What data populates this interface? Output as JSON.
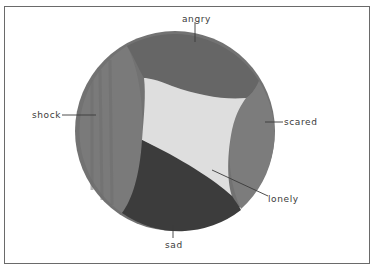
{
  "diagram": {
    "type": "emotion-wheel-drawing",
    "regions": [
      {
        "id": "angry",
        "label": "angry",
        "color": "#666666"
      },
      {
        "id": "shock",
        "label": "shock",
        "color": "#7a7a7a"
      },
      {
        "id": "scared",
        "label": "scared",
        "color": "#7c7c7c"
      },
      {
        "id": "sad",
        "label": "sad",
        "color": "#3c3c3c"
      },
      {
        "id": "lonely",
        "label": "lonely",
        "color": "#dedede"
      }
    ],
    "labels": {
      "angry": "angry",
      "shock": "shock",
      "scared": "scared",
      "lonely": "lonely",
      "sad": "sad"
    },
    "frame_color": "#6a6a6a",
    "background": "#ffffff"
  }
}
